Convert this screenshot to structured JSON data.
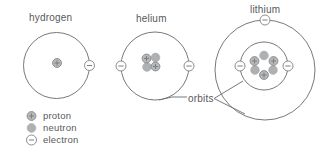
{
  "figure": {
    "atoms": [
      {
        "label": "hydrogen",
        "protons": 1,
        "neutrons": 0,
        "electrons": 1,
        "orbit_count": 1
      },
      {
        "label": "helium",
        "protons": 2,
        "neutrons": 2,
        "electrons": 2,
        "orbit_count": 1
      },
      {
        "label": "lithium",
        "protons": 3,
        "neutrons": 3,
        "electrons": 3,
        "orbit_count": 2
      }
    ],
    "annotation": {
      "orbits_label": "orbits"
    },
    "legend": [
      {
        "icon": "proton-icon",
        "label": "proton"
      },
      {
        "icon": "neutron-icon",
        "label": "neutron"
      },
      {
        "icon": "electron-icon",
        "label": "electron"
      }
    ],
    "colors": {
      "line": "#77797c",
      "text": "#58595b",
      "proton_fill": "#b6b8ba",
      "neutron_fill": "#aeb0b2",
      "electron_fill": "#ffffff",
      "symbol_stroke": "#7c7e81"
    }
  }
}
